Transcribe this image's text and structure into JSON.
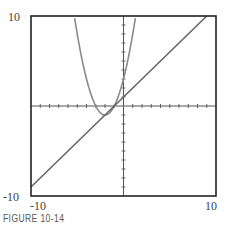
{
  "chart_data": {
    "type": "line",
    "title": "",
    "caption": "FIGURE 10-14",
    "xlabel": "",
    "ylabel": "",
    "xlim": [
      -10,
      10
    ],
    "ylim": [
      -10,
      10
    ],
    "grid": false,
    "axes_ticks": "unit tick marks on both axes",
    "tick_labels": {
      "x_min": "-10",
      "x_max": "10",
      "y_min": "-10",
      "y_max": "10"
    },
    "series": [
      {
        "name": "parabola",
        "expression": "y = (x+2)^2 - 1",
        "color": "#888888",
        "points": [
          [
            -5.3,
            9.9
          ],
          [
            -5,
            8
          ],
          [
            -4,
            3
          ],
          [
            -3,
            0
          ],
          [
            -2,
            -1
          ],
          [
            -1,
            0
          ],
          [
            0,
            3
          ],
          [
            1,
            8
          ],
          [
            1.3,
            9.9
          ]
        ]
      },
      {
        "name": "line",
        "expression": "y = x + 1",
        "color": "#666666",
        "points": [
          [
            -10,
            -9
          ],
          [
            9,
            10
          ]
        ]
      }
    ]
  },
  "labels": {
    "y_max": "10",
    "y_min": "-10",
    "x_min": "-10",
    "x_max": "10",
    "caption": "FIGURE 10-14"
  }
}
